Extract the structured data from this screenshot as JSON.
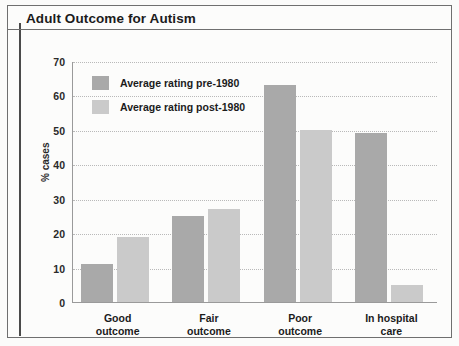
{
  "figure": {
    "title": "Adult Outcome for Autism"
  },
  "chart_data": {
    "type": "bar",
    "title": "Adult Outcome for Autism",
    "xlabel": "",
    "ylabel": "% cases",
    "ylim": [
      0,
      70
    ],
    "ytick_step": 10,
    "yticks": [
      "70",
      "60",
      "50",
      "40",
      "30",
      "20",
      "10",
      "0"
    ],
    "grid": true,
    "legend_position": "top-left inside plot",
    "categories": [
      "Good\noutcome",
      "Fair\noutcome",
      "Poor\noutcome",
      "In hospital\ncare"
    ],
    "category_lines": [
      [
        "Good",
        "outcome"
      ],
      [
        "Fair",
        "outcome"
      ],
      [
        "Poor",
        "outcome"
      ],
      [
        "In hospital",
        "care"
      ]
    ],
    "series": [
      {
        "name": "Average rating pre-1980",
        "color": "#a9a9a9",
        "values": [
          11,
          25,
          63,
          49
        ]
      },
      {
        "name": "Average rating post-1980",
        "color": "#cacaca",
        "values": [
          19,
          27,
          50,
          5
        ]
      }
    ]
  },
  "colors": {
    "frame": "#6f6f6f",
    "left_bar": "#4a4a4a",
    "axis": "#9a9a9a",
    "grid": "#b9b9b9",
    "text": "#1b1b1b",
    "background": "#fcfcfb"
  }
}
